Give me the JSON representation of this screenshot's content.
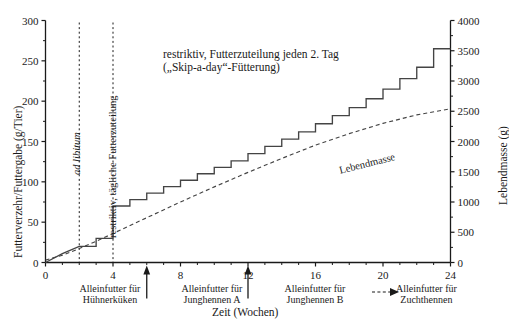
{
  "chart_data": {
    "type": "line",
    "title": "restriktiv, Futterzuteilung jeden 2. Tag („Skip-a-day“-Fütterung)",
    "title_line1": "restriktiv, Futterzuteilung jeden 2. Tag",
    "title_line2": "(„Skip-a-day“-Fütterung)",
    "xlabel": "Zeit (Wochen)",
    "ylabel": "Futterverzehr/Futtergabe (g/Tier)",
    "y2label": "Lebendmasse (g)",
    "xlim": [
      0,
      24
    ],
    "ylim": [
      0,
      300
    ],
    "y2lim": [
      0,
      4000
    ],
    "xticks": [
      0,
      4,
      8,
      12,
      16,
      20,
      24
    ],
    "xticklabels": [
      "0",
      "4",
      "8",
      "12",
      "16",
      "20",
      "24"
    ],
    "yticks": [
      0,
      50,
      100,
      150,
      200,
      250,
      300
    ],
    "yticklabels": [
      "0",
      "50",
      "100",
      "150",
      "200",
      "250",
      "300"
    ],
    "y2ticks": [
      0,
      500,
      1000,
      1500,
      2000,
      2500,
      3000,
      3500,
      4000
    ],
    "y2ticklabels": [
      "0",
      "500",
      "1000",
      "1500",
      "2000",
      "2500",
      "3000",
      "3500",
      "4000"
    ],
    "grid": false,
    "legend_position": "bottom-right",
    "series": [
      {
        "name": "Futterverzehr/Futtergabe",
        "style": "solid-step",
        "axis": "left",
        "points_x": [
          0,
          1,
          2,
          3,
          3,
          4,
          4,
          5,
          5,
          6,
          6,
          7,
          7,
          8,
          8,
          9,
          9,
          10,
          10,
          11,
          11,
          12,
          12,
          13,
          13,
          14,
          14,
          15,
          15,
          16,
          16,
          17,
          17,
          18,
          18,
          19,
          19,
          20,
          20,
          21,
          21,
          22,
          22,
          23,
          23,
          24
        ],
        "points_y": [
          0,
          11,
          20,
          20,
          30,
          30,
          70,
          70,
          78,
          78,
          86,
          86,
          94,
          94,
          102,
          102,
          110,
          110,
          118,
          118,
          126,
          126,
          135,
          135,
          144,
          144,
          153,
          153,
          162,
          162,
          172,
          172,
          182,
          182,
          192,
          192,
          203,
          203,
          215,
          215,
          228,
          228,
          242,
          242,
          265,
          265
        ]
      },
      {
        "name": "Lebendmasse",
        "style": "dashed",
        "axis": "right",
        "label": "Lebendmasse",
        "points_x": [
          0,
          1,
          2,
          3,
          4,
          6,
          8,
          10,
          12,
          14,
          16,
          18,
          20,
          22,
          24
        ],
        "points_y": [
          40,
          120,
          230,
          350,
          480,
          740,
          1000,
          1250,
          1490,
          1720,
          1940,
          2130,
          2300,
          2440,
          2540
        ]
      }
    ],
    "annotations": [
      {
        "name": "ad-libitum",
        "text": "ad libitum",
        "x_week": 1.0,
        "orientation": "vertical",
        "style": "italic"
      },
      {
        "name": "restriktiv-taeglich",
        "text": "restriktiv, tägliche Futterzuteilung",
        "x_week": 3.0,
        "orientation": "vertical",
        "style": "normal"
      }
    ],
    "vlines": [
      {
        "name": "vline-week-2",
        "x_week": 2,
        "style": "dotted"
      },
      {
        "name": "vline-week-4",
        "x_week": 4,
        "style": "dotted"
      }
    ],
    "phase_arrows": [
      {
        "name": "phase-arrow-week-6",
        "x_week": 6
      },
      {
        "name": "phase-arrow-week-12",
        "x_week": 12
      }
    ],
    "phase_labels": [
      {
        "name": "phase-label-huehnerkueken",
        "line1": "Alleinfutter für",
        "line2": "Hühnerküken",
        "x_week": 2.6
      },
      {
        "name": "phase-label-junghennen-a",
        "line1": "Alleinfutter für",
        "line2": "Junghennen A",
        "x_week": 8.6
      },
      {
        "name": "phase-label-junghennen-b",
        "line1": "Alleinfutter für",
        "line2": "Junghennen B",
        "x_week": 16.0
      },
      {
        "name": "phase-label-zuchthennen",
        "line1": "Alleinfutter für",
        "line2": "Zuchthennen",
        "x_week": 22.3
      }
    ],
    "legend": {
      "name": "legend-lebendmasse-arrow",
      "marker": "dashed-arrow",
      "text_line1": "Alleinfutter für",
      "text_line2": "Zuchthennen"
    },
    "colors": {
      "line": "#444444",
      "axis": "#1a1a1a",
      "text": "#1a1a1a",
      "background": "#ffffff"
    }
  }
}
